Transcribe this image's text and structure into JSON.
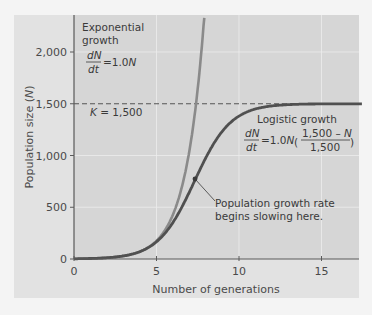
{
  "chart_data": {
    "type": "line",
    "title": "",
    "xlabel": "Number of generations",
    "ylabel": "Population size (N)",
    "xlim": [
      0,
      17.5
    ],
    "ylim": [
      0,
      2350
    ],
    "x_ticks": [
      0,
      5,
      10,
      15
    ],
    "x_tick_labels": [
      "0",
      "5",
      "10",
      "15"
    ],
    "y_ticks": [
      0,
      500,
      1000,
      1500,
      2000
    ],
    "y_tick_labels": [
      "0",
      "500",
      "1,000",
      "1,500",
      "2,000"
    ],
    "grid": true,
    "carrying_capacity": {
      "value": 1500,
      "label": "K = 1,500",
      "style": "dashed"
    },
    "series": [
      {
        "name": "Exponential growth",
        "equation": "dN/dt = 1.0N",
        "color": "#8a8a8a",
        "x": [
          0,
          1,
          2,
          3,
          4,
          5,
          5.5,
          6,
          6.5,
          7,
          7.25,
          7.5,
          7.9
        ],
        "values": [
          2,
          5,
          15,
          40,
          110,
          300,
          490,
          800,
          1150,
          1380,
          1500,
          1800,
          2330
        ]
      },
      {
        "name": "Logistic growth",
        "equation": "dN/dt = 1.0N((1,500 - N)/1,500)",
        "color": "#505050",
        "x": [
          0,
          1,
          2,
          3,
          4,
          5,
          6,
          7,
          7.3,
          8,
          9,
          10,
          11,
          12,
          13,
          15,
          17.5
        ],
        "values": [
          2,
          5,
          12,
          30,
          90,
          230,
          440,
          700,
          780,
          960,
          1200,
          1360,
          1440,
          1480,
          1495,
          1500,
          1500
        ]
      }
    ],
    "annotations": [
      {
        "text_lines": [
          "Population growth rate",
          "begins slowing here."
        ],
        "points_to": {
          "x": 7.3,
          "y": 780
        }
      }
    ]
  },
  "labels": {
    "exp_title_1": "Exponential",
    "exp_title_2": "growth",
    "log_title": "Logistic growth",
    "k_label": "K = 1,500",
    "anno_1": "Population growth rate",
    "anno_2": "begins slowing here."
  }
}
